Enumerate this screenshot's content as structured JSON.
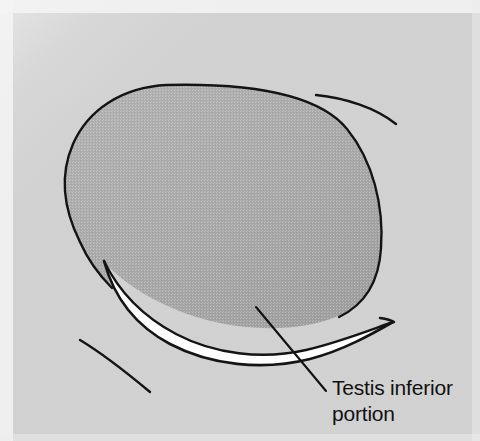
{
  "figure": {
    "kind": "anatomical-line-illustration",
    "subject": "Testis inferior portion",
    "width": 480,
    "height": 441,
    "background_color": "#d2d2d2",
    "paper_margin_color": "#f4f4f4",
    "organ_fill_color": "#a9a9a9",
    "organ_outline_color": "#141414",
    "highlight_fill_color": "#ffffff",
    "leader_line_color": "#111111",
    "text_color": "#111111"
  },
  "annotations": [
    {
      "id": "testis-inferior-portion",
      "line1": "Testis inferior",
      "line2": "portion",
      "text_x": 332,
      "text_y_line1": 395,
      "text_y_line2": 421,
      "leader_from_x": 256,
      "leader_from_y": 307,
      "leader_to_x": 326,
      "leader_to_y": 391
    }
  ],
  "shapes": {
    "organ_body": {
      "name": "testis-body",
      "description": "large shaded ovoid organ mass occupying the upper-centre of the frame"
    },
    "highlight_crescent": {
      "name": "inferior-portion-highlight",
      "description": "white crescent sweeping along the lower-left to lower-right border of the organ"
    },
    "accent_arc_top_right": {
      "name": "accent-arc-top-right",
      "from_x": 316,
      "from_y": 95,
      "to_x": 396,
      "to_y": 124
    },
    "accent_arc_bottom_left": {
      "name": "accent-arc-bottom-left",
      "from_x": 80,
      "from_y": 340,
      "to_x": 150,
      "to_y": 392
    }
  }
}
